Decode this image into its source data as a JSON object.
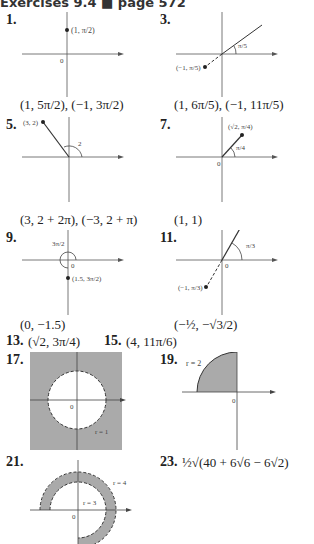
{
  "header": {
    "title": "Exercises 9.4 ■ page 572"
  },
  "exercises": [
    {
      "number": "1.",
      "answer": "(1, 5π/2), (−1, 3π/2)",
      "point_label": "(1, π/2)",
      "origin_label": "0"
    },
    {
      "number": "3.",
      "answer": "(1, 6π/5), (−1, 11π/5)",
      "point_label": "(−1, π/5)",
      "angle_label": "π/5"
    },
    {
      "number": "5.",
      "answer": "(3, 2 + 2π), (−3, 2 + π)",
      "point_label": "(3, 2)",
      "angle_label": "2"
    },
    {
      "number": "7.",
      "answer": "(1, 1)",
      "point_label": "(√2, π/4)",
      "angle_label": "π/4",
      "origin_label": "0"
    },
    {
      "number": "9.",
      "answer": "(0, −1.5)",
      "point_label": "(1.5, 3π/2)",
      "angle_label": "3π/2",
      "origin_label": "0"
    },
    {
      "number": "11.",
      "answer": "(−½, −√3/2)",
      "point_label": "(−1, π/3)",
      "angle_label": "π/3",
      "origin_label": "0"
    },
    {
      "number": "13.",
      "answer": "(√2, 3π/4)"
    },
    {
      "number": "15.",
      "answer": "(4, 11π/6)"
    },
    {
      "number": "17.",
      "radius_label": "r = 1",
      "origin_label": "0"
    },
    {
      "number": "19.",
      "radius_label": "r = 2",
      "origin_label": "0"
    },
    {
      "number": "21.",
      "outer_radius_label": "r = 4",
      "inner_radius_label": "r = 3",
      "origin_label": "0"
    },
    {
      "number": "23.",
      "answer": "½√(40 + 6√6 − 6√2)"
    }
  ]
}
